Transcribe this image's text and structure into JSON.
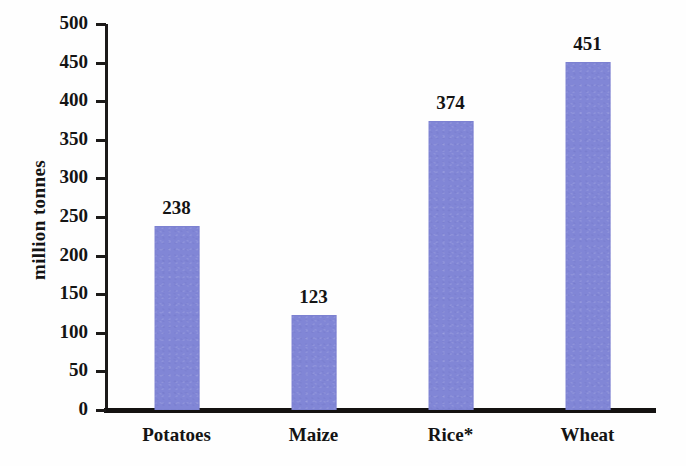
{
  "chart_data": {
    "type": "bar",
    "title": "",
    "subtitle": "",
    "xlabel": "",
    "ylabel": "million tonnes",
    "categories": [
      "Potatoes",
      "Maize",
      "Rice*",
      "Wheat"
    ],
    "values": [
      238,
      123,
      374,
      451
    ],
    "value_labels": [
      "238",
      "123",
      "374",
      "451"
    ],
    "ylim": [
      0,
      500
    ],
    "ytick_step": 50,
    "yticks": [
      0,
      50,
      100,
      150,
      200,
      250,
      300,
      350,
      400,
      450,
      500
    ],
    "ytick_labels": [
      "0",
      "50",
      "100",
      "150",
      "200",
      "250",
      "300",
      "350",
      "400",
      "450",
      "500"
    ],
    "grid": false,
    "legend": null,
    "legend_position": "none",
    "annotations": [
      "* asterisk on Rice category label"
    ],
    "colors": {
      "bar": "#8186d6",
      "axis": "#141211",
      "text": "#141414",
      "background": "#fefefe"
    }
  },
  "axis": {
    "y_title": "million tonnes"
  }
}
